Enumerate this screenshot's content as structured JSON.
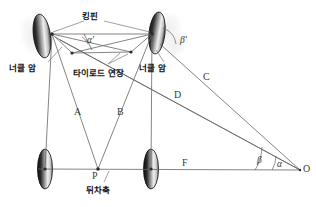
{
  "figure": {
    "title_alt": "Ackermann steering geometry diagram",
    "background": "#ffffff",
    "line_color": "#555555",
    "wheel_dark": "#111111",
    "wheel_light": "#f2f2f2"
  },
  "labels": {
    "kingpin": "킹핀",
    "knuckle_arm_left": "너클 암",
    "knuckle_arm_right": "너클 암",
    "tie_rod": "타이로드 연장",
    "rear_axle": "뒤차축"
  },
  "segments": {
    "a": "A",
    "b": "B",
    "c": "C",
    "d": "D",
    "f": "F"
  },
  "points": {
    "p": "P",
    "o": "O"
  },
  "angles": {
    "alpha_prime": "α'",
    "beta_prime": "β'",
    "alpha": "α",
    "beta": "β"
  }
}
